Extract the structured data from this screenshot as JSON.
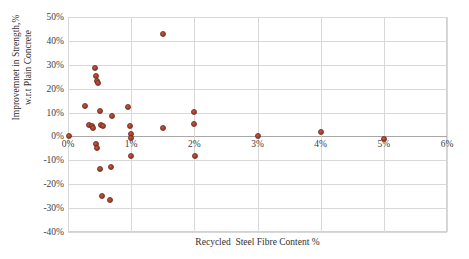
{
  "chart_data": {
    "type": "scatter",
    "title": "",
    "xlabel": "Recycled  Steel Fibre Content %",
    "ylabel_line1": "Improvemnet in Strength,%",
    "ylabel_line2": "w.r.t Plain Concrete",
    "xlim": [
      0,
      6
    ],
    "ylim": [
      -40,
      50
    ],
    "grid": true,
    "legend": "none",
    "marker_color": "#a8412c",
    "gridline_color": "#d8d8d8",
    "axis_color": "#a8a8a8",
    "xticks": [
      {
        "value": 0,
        "label": "0%"
      },
      {
        "value": 1,
        "label": "1%"
      },
      {
        "value": 2,
        "label": "2%"
      },
      {
        "value": 3,
        "label": "3%"
      },
      {
        "value": 4,
        "label": "4%"
      },
      {
        "value": 5,
        "label": "5%"
      },
      {
        "value": 6,
        "label": "6%"
      }
    ],
    "yticks": [
      {
        "value": 50,
        "label": "50%"
      },
      {
        "value": 40,
        "label": "40%"
      },
      {
        "value": 30,
        "label": "30%"
      },
      {
        "value": 20,
        "label": "20%"
      },
      {
        "value": 10,
        "label": "10%"
      },
      {
        "value": 0,
        "label": "0%"
      },
      {
        "value": -10,
        "label": "-10%"
      },
      {
        "value": -20,
        "label": "-20%"
      },
      {
        "value": -30,
        "label": "-30%"
      },
      {
        "value": -40,
        "label": "-40%"
      }
    ],
    "points": [
      {
        "x": 0.02,
        "y": 0.0
      },
      {
        "x": 0.27,
        "y": 12.8
      },
      {
        "x": 0.33,
        "y": 4.8
      },
      {
        "x": 0.38,
        "y": 4.2
      },
      {
        "x": 0.4,
        "y": 3.4
      },
      {
        "x": 0.42,
        "y": 28.8
      },
      {
        "x": 0.45,
        "y": 25.3
      },
      {
        "x": 0.46,
        "y": 23.2
      },
      {
        "x": 0.47,
        "y": 22.2
      },
      {
        "x": 0.44,
        "y": -3.2
      },
      {
        "x": 0.46,
        "y": -5.0
      },
      {
        "x": 0.5,
        "y": 10.8
      },
      {
        "x": 0.52,
        "y": 4.6
      },
      {
        "x": 0.5,
        "y": -13.8
      },
      {
        "x": 0.56,
        "y": 4.3
      },
      {
        "x": 0.54,
        "y": -24.8
      },
      {
        "x": 0.66,
        "y": -26.8
      },
      {
        "x": 0.7,
        "y": 8.4
      },
      {
        "x": 0.68,
        "y": -12.8
      },
      {
        "x": 0.95,
        "y": 12.5
      },
      {
        "x": 0.98,
        "y": 4.4
      },
      {
        "x": 0.99,
        "y": 1.2
      },
      {
        "x": 0.99,
        "y": -0.6
      },
      {
        "x": 1.0,
        "y": -8.2
      },
      {
        "x": 1.5,
        "y": 43.0
      },
      {
        "x": 1.5,
        "y": 3.6
      },
      {
        "x": 2.0,
        "y": 10.2
      },
      {
        "x": 2.0,
        "y": 5.2
      },
      {
        "x": 2.01,
        "y": -8.0
      },
      {
        "x": 3.0,
        "y": 0.0
      },
      {
        "x": 4.0,
        "y": 1.8
      },
      {
        "x": 5.0,
        "y": -1.2
      }
    ]
  }
}
